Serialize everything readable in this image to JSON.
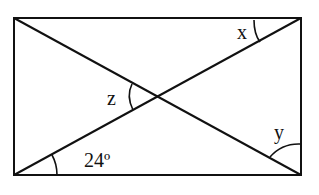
{
  "diagram": {
    "shape": "rectangle with two diagonals",
    "labels": {
      "x": "x",
      "y": "y",
      "z": "z",
      "angle_given": "24º"
    },
    "colors": {
      "stroke": "#111111",
      "background": "#ffffff"
    }
  }
}
